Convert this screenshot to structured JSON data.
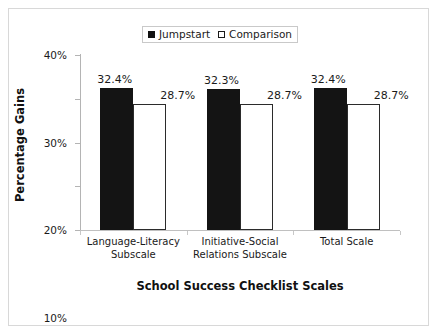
{
  "chart_data": {
    "type": "bar",
    "title": "",
    "xlabel": "School Success Checklist Scales",
    "ylabel": "Percentage Gains",
    "categories": [
      "Language-Literacy Subscale",
      "Initiative-Social Relations Subscale",
      "Total Scale"
    ],
    "category_lines": [
      [
        "Language-Literacy",
        "Subscale"
      ],
      [
        "Initiative-Social",
        "Relations Subscale"
      ],
      [
        "Total Scale"
      ]
    ],
    "series": [
      {
        "name": "Jumpstart",
        "color": "#141414",
        "values": [
          32.4,
          32.3,
          32.4
        ],
        "labels": [
          "32.4%",
          "32.4%",
          "32.4%"
        ]
      },
      {
        "name": "Comparison",
        "color": "#ffffff",
        "values": [
          28.7,
          28.7,
          28.7
        ],
        "labels": [
          "28.7%",
          "28.7%",
          "28.7%"
        ]
      }
    ],
    "ylim": [
      0,
      40
    ],
    "yticks": [
      0,
      10,
      20,
      30,
      40
    ],
    "ytick_labels": [
      "0%",
      "10%",
      "20%",
      "30%",
      "40%"
    ],
    "grid": false,
    "legend_position": "top-center",
    "bar_labels": {
      "group_0": {
        "jumpstart": "32.4%",
        "comparison": "28.7%"
      },
      "group_1": {
        "jumpstart": "32.3%",
        "comparison": "28.7%"
      },
      "group_2": {
        "jumpstart": "32.4%",
        "comparison": "28.7%"
      }
    }
  },
  "legend": {
    "items": [
      {
        "label": "Jumpstart",
        "marker": "filled-square-marker"
      },
      {
        "label": "Comparison",
        "marker": "open-square-marker"
      }
    ]
  }
}
